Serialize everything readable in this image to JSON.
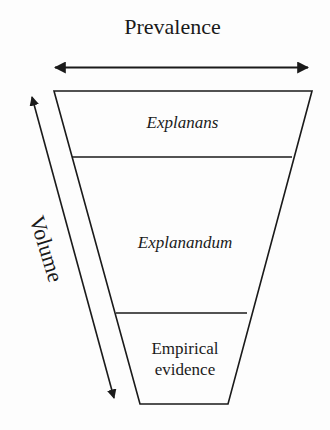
{
  "diagram": {
    "type": "inverted-funnel",
    "horizontal_axis": {
      "label": "Prevalence",
      "direction": "bidirectional"
    },
    "vertical_axis": {
      "label": "Volume",
      "direction": "bidirectional"
    },
    "layers": [
      {
        "label": "Explanans",
        "style": "italic"
      },
      {
        "label": "Explanandum",
        "style": "italic"
      },
      {
        "label": "Empirical evidence",
        "style": "normal"
      }
    ],
    "colors": {
      "stroke": "#1a1a1a",
      "background": "#fdfdfd"
    }
  }
}
